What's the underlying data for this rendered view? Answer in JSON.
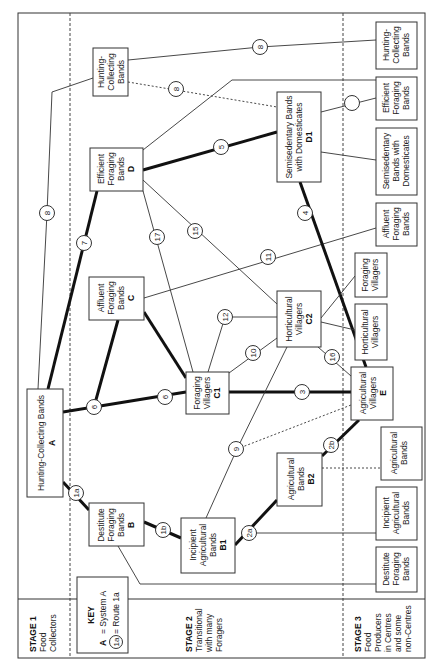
{
  "diagram": {
    "orientation": "rotated 90 degrees counter-clockwise",
    "stages": [
      {
        "id": "stage1",
        "title": "STAGE 1",
        "lines": [
          "Food",
          "Collectors"
        ]
      },
      {
        "id": "stage2",
        "title": "STAGE 2",
        "lines": [
          "Transitional",
          "with many",
          "Foragers"
        ]
      },
      {
        "id": "stage3",
        "title": "STAGE 3",
        "lines": [
          "Food",
          "Producers",
          "in Centres",
          "and some",
          "non-Centres"
        ]
      }
    ],
    "key": {
      "title": "KEY",
      "system_symbol": "A",
      "system_label": "= System A",
      "route_symbol": "1a",
      "route_label": "= Route 1a"
    },
    "systems": [
      {
        "id": "A",
        "lines": [
          "Hunting-Collecting Bands"
        ],
        "code": "A"
      },
      {
        "id": "B",
        "lines": [
          "Destitute",
          "Foraging",
          "Bands"
        ],
        "code": "B"
      },
      {
        "id": "B1",
        "lines": [
          "Incipient",
          "Agricultural",
          "Bands"
        ],
        "code": "B1"
      },
      {
        "id": "B2",
        "lines": [
          "Agricultural",
          "Bands"
        ],
        "code": "B2"
      },
      {
        "id": "C",
        "lines": [
          "Affluent",
          "Foraging",
          "Bands"
        ],
        "code": "C"
      },
      {
        "id": "C1",
        "lines": [
          "Foraging",
          "Villagers"
        ],
        "code": "C1"
      },
      {
        "id": "C2",
        "lines": [
          "Horticultural",
          "Villagers"
        ],
        "code": "C2"
      },
      {
        "id": "D",
        "lines": [
          "Efficient",
          "Foraging",
          "Bands"
        ],
        "code": "D"
      },
      {
        "id": "D1",
        "lines": [
          "Semisedentary Bands",
          "with Domesticates"
        ],
        "code": "D1"
      },
      {
        "id": "E",
        "lines": [
          "Agricultural",
          "Villagers"
        ],
        "code": "E"
      },
      {
        "id": "HCB1",
        "lines": [
          "Hunting-",
          "Collecting",
          "Bands"
        ],
        "code": ""
      }
    ],
    "stage3_outcomes": [
      {
        "id": "o_hcb",
        "lines": [
          "Hunting-",
          "Collecting",
          "Bands"
        ]
      },
      {
        "id": "o_efb",
        "lines": [
          "Efficient",
          "Foraging",
          "Bands"
        ]
      },
      {
        "id": "o_sbd",
        "lines": [
          "Semisedentary",
          "Bands with",
          "Domesticates"
        ]
      },
      {
        "id": "o_afb",
        "lines": [
          "Affluent",
          "Foraging",
          "Bands"
        ]
      },
      {
        "id": "o_fv",
        "lines": [
          "Foraging",
          "Villagers"
        ]
      },
      {
        "id": "o_hv",
        "lines": [
          "Horticultural",
          "Villagers"
        ]
      },
      {
        "id": "o_ab",
        "lines": [
          "Agricultural",
          "Bands"
        ]
      },
      {
        "id": "o_iab",
        "lines": [
          "Incipient",
          "Agricultural",
          "Bands"
        ]
      },
      {
        "id": "o_dfb",
        "lines": [
          "Destitute",
          "Foraging",
          "Bands"
        ]
      }
    ],
    "routes": [
      {
        "label": "1a",
        "from": "A",
        "to": "B",
        "style": "thick"
      },
      {
        "label": "1b",
        "from": "B",
        "to": "B1",
        "style": "thick"
      },
      {
        "label": "2a",
        "from": "B1",
        "to": "B2",
        "style": "thick"
      },
      {
        "label": "2b",
        "from": "B2",
        "to": "E",
        "style": "thick"
      },
      {
        "label": "3",
        "from": "C1",
        "to": "E",
        "style": "thick"
      },
      {
        "label": "4",
        "from": "D1",
        "to": "E",
        "style": "thick"
      },
      {
        "label": "5",
        "from": "D",
        "to": "D1",
        "style": "thick"
      },
      {
        "label": "6",
        "from": "A",
        "to": "C",
        "style": "thick"
      },
      {
        "label": "6",
        "from": "A",
        "to": "C1",
        "style": "thick"
      },
      {
        "label": "7",
        "from": "A",
        "to": "D",
        "style": "thick"
      },
      {
        "label": "8",
        "from": "HCB1",
        "to": "D1",
        "style": "dashed"
      },
      {
        "label": "9",
        "from": "B1",
        "to": "C2 / E",
        "style": "thin/dashed"
      },
      {
        "label": "10",
        "from": "C1",
        "to": "C2",
        "style": "thin"
      },
      {
        "label": "11",
        "from": "C",
        "to": "Affluent Foraging Bands",
        "style": "thin"
      },
      {
        "label": "12",
        "from": "C1",
        "to": "C2",
        "style": "thin"
      },
      {
        "label": "13",
        "from": "A",
        "to": "Hunting-Collecting Bands",
        "style": "thin"
      },
      {
        "label": "14",
        "from": "D",
        "to": "C2",
        "style": "thin"
      },
      {
        "label": "15",
        "from": "C2",
        "to": "E",
        "style": "thin"
      },
      {
        "label": "16",
        "from": "D",
        "to": "C1",
        "style": "thin"
      },
      {
        "label": "17",
        "from": "D1",
        "to": "Efficient Foraging Bands",
        "style": "thin"
      }
    ]
  }
}
